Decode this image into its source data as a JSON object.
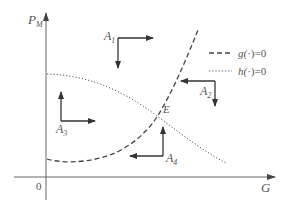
{
  "diagram": {
    "type": "phase-plane",
    "axes": {
      "y_label": "P",
      "y_label_sub": "M",
      "x_label": "G",
      "origin_label": "0"
    },
    "legend": [
      {
        "style": "dashed",
        "func": "g",
        "text": "g(·)=0"
      },
      {
        "style": "dotted",
        "func": "h",
        "text": "h(·)=0"
      }
    ],
    "legend_text": {
      "g_prefix": "g(",
      "g_suffix": ")=0",
      "h_prefix": "h(",
      "h_suffix": ")=0",
      "dot": "·"
    },
    "curves": [
      {
        "name": "g",
        "style": "dashed",
        "description": "U-shaped increasing curve from low P_M at G=0 rising steeply"
      },
      {
        "name": "h",
        "style": "dotted",
        "description": "decreasing curve from high P_M at G=0"
      }
    ],
    "intersection": {
      "label": "E"
    },
    "regions": [
      {
        "label": "A",
        "sub": "1",
        "arrows": [
          "right",
          "down"
        ]
      },
      {
        "label": "A",
        "sub": "2",
        "arrows": [
          "left",
          "down"
        ]
      },
      {
        "label": "A",
        "sub": "3",
        "arrows": [
          "up",
          "right"
        ]
      },
      {
        "label": "A",
        "sub": "4",
        "arrows": [
          "up",
          "left"
        ]
      }
    ],
    "colors": {
      "axis": "#555555",
      "curve": "#444444",
      "arrow": "#333333",
      "text": "#555555"
    }
  }
}
